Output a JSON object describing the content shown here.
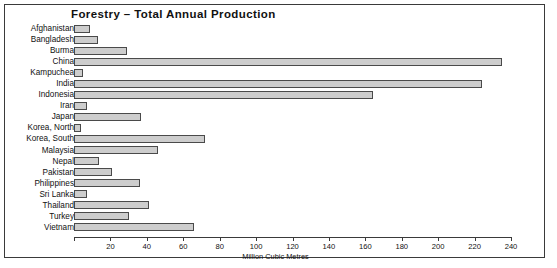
{
  "chart_data": {
    "type": "bar",
    "orientation": "horizontal",
    "title": "Forestry – Total Annual Production",
    "xlabel": "Million Cubic Metres",
    "ylabel": "",
    "xlim": [
      0,
      240
    ],
    "xticks": [
      0,
      20,
      40,
      60,
      80,
      100,
      120,
      140,
      160,
      180,
      200,
      220,
      240
    ],
    "xtick_labels": [
      "",
      "20",
      "40",
      "60",
      "80",
      "100",
      "120",
      "140",
      "160",
      "180",
      "200",
      "220",
      "240"
    ],
    "grid": false,
    "legend": "none",
    "bar_fill_color": "#cdcdcd",
    "bar_edge_color": "#4a4a4a",
    "categories": [
      "Afghanistan",
      "Bangladesh",
      "Burma",
      "China",
      "Kampuchea",
      "India",
      "Indonesia",
      "Iran",
      "Japan",
      "Korea, North",
      "Korea, South",
      "Malaysia",
      "Nepal",
      "Pakistan",
      "Philippines",
      "Sri Lanka",
      "Thailand",
      "Turkey",
      "Vietnam"
    ],
    "values": [
      9,
      13,
      29,
      235,
      5,
      224,
      164,
      7,
      37,
      4,
      72,
      46,
      14,
      21,
      36,
      7,
      41,
      30,
      66
    ]
  }
}
